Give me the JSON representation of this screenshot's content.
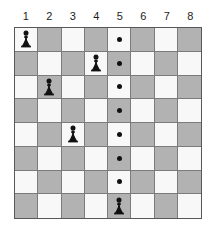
{
  "board": {
    "title": "chess-pawn-grid-puzzle",
    "columns": 8,
    "rows": 8,
    "column_headers": [
      "1",
      "2",
      "3",
      "4",
      "5",
      "6",
      "7",
      "8"
    ],
    "light_square_color": "#f8f8f8",
    "dark_square_color": "#b2b2b2",
    "grid_line_color": "#7b7b7d",
    "border_color": "#58585a",
    "marker_color": "#111111",
    "piece_color": "#111111",
    "light_square_parity": "row+col even",
    "cells": [
      [
        {
          "shade": "light",
          "content": "pawn"
        },
        {
          "shade": "dark",
          "content": "empty"
        },
        {
          "shade": "light",
          "content": "empty"
        },
        {
          "shade": "dark",
          "content": "empty"
        },
        {
          "shade": "light",
          "content": "dot"
        },
        {
          "shade": "dark",
          "content": "empty"
        },
        {
          "shade": "light",
          "content": "empty"
        },
        {
          "shade": "dark",
          "content": "empty"
        }
      ],
      [
        {
          "shade": "dark",
          "content": "empty"
        },
        {
          "shade": "light",
          "content": "empty"
        },
        {
          "shade": "dark",
          "content": "empty"
        },
        {
          "shade": "light",
          "content": "pawn"
        },
        {
          "shade": "dark",
          "content": "dot"
        },
        {
          "shade": "light",
          "content": "empty"
        },
        {
          "shade": "dark",
          "content": "empty"
        },
        {
          "shade": "light",
          "content": "empty"
        }
      ],
      [
        {
          "shade": "light",
          "content": "empty"
        },
        {
          "shade": "dark",
          "content": "pawn"
        },
        {
          "shade": "light",
          "content": "empty"
        },
        {
          "shade": "dark",
          "content": "empty"
        },
        {
          "shade": "light",
          "content": "dot"
        },
        {
          "shade": "dark",
          "content": "empty"
        },
        {
          "shade": "light",
          "content": "empty"
        },
        {
          "shade": "dark",
          "content": "empty"
        }
      ],
      [
        {
          "shade": "dark",
          "content": "empty"
        },
        {
          "shade": "light",
          "content": "empty"
        },
        {
          "shade": "dark",
          "content": "empty"
        },
        {
          "shade": "light",
          "content": "empty"
        },
        {
          "shade": "dark",
          "content": "dot"
        },
        {
          "shade": "light",
          "content": "empty"
        },
        {
          "shade": "dark",
          "content": "empty"
        },
        {
          "shade": "light",
          "content": "empty"
        }
      ],
      [
        {
          "shade": "light",
          "content": "empty"
        },
        {
          "shade": "dark",
          "content": "empty"
        },
        {
          "shade": "light",
          "content": "pawn"
        },
        {
          "shade": "dark",
          "content": "empty"
        },
        {
          "shade": "light",
          "content": "dot"
        },
        {
          "shade": "dark",
          "content": "empty"
        },
        {
          "shade": "light",
          "content": "empty"
        },
        {
          "shade": "dark",
          "content": "empty"
        }
      ],
      [
        {
          "shade": "dark",
          "content": "empty"
        },
        {
          "shade": "light",
          "content": "empty"
        },
        {
          "shade": "dark",
          "content": "empty"
        },
        {
          "shade": "light",
          "content": "empty"
        },
        {
          "shade": "dark",
          "content": "dot"
        },
        {
          "shade": "light",
          "content": "empty"
        },
        {
          "shade": "dark",
          "content": "empty"
        },
        {
          "shade": "light",
          "content": "empty"
        }
      ],
      [
        {
          "shade": "light",
          "content": "empty"
        },
        {
          "shade": "dark",
          "content": "empty"
        },
        {
          "shade": "light",
          "content": "empty"
        },
        {
          "shade": "dark",
          "content": "empty"
        },
        {
          "shade": "light",
          "content": "dot"
        },
        {
          "shade": "dark",
          "content": "empty"
        },
        {
          "shade": "light",
          "content": "empty"
        },
        {
          "shade": "dark",
          "content": "empty"
        }
      ],
      [
        {
          "shade": "dark",
          "content": "empty"
        },
        {
          "shade": "light",
          "content": "empty"
        },
        {
          "shade": "dark",
          "content": "empty"
        },
        {
          "shade": "light",
          "content": "empty"
        },
        {
          "shade": "dark",
          "content": "pawn"
        },
        {
          "shade": "light",
          "content": "empty"
        },
        {
          "shade": "dark",
          "content": "empty"
        },
        {
          "shade": "light",
          "content": "empty"
        }
      ]
    ],
    "pawn_positions": [
      {
        "row": 1,
        "column": 1
      },
      {
        "row": 2,
        "column": 4
      },
      {
        "row": 3,
        "column": 2
      },
      {
        "row": 5,
        "column": 3
      },
      {
        "row": 8,
        "column": 5
      }
    ],
    "dot_positions": [
      {
        "row": 1,
        "column": 5
      },
      {
        "row": 2,
        "column": 5
      },
      {
        "row": 3,
        "column": 5
      },
      {
        "row": 4,
        "column": 5
      },
      {
        "row": 5,
        "column": 5
      },
      {
        "row": 6,
        "column": 5
      },
      {
        "row": 7,
        "column": 5
      }
    ]
  }
}
